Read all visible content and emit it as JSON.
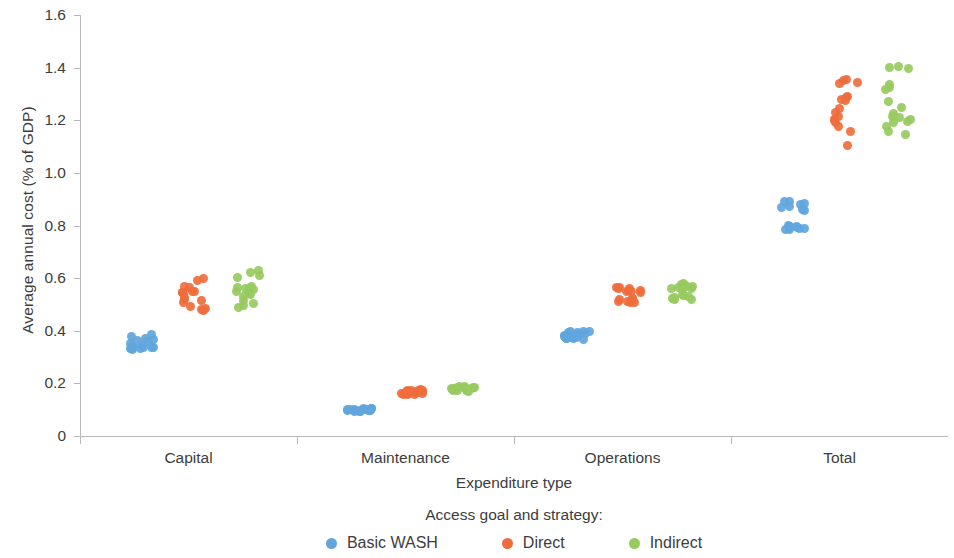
{
  "chart_data": {
    "type": "scatter",
    "title": "",
    "xlabel": "Expenditure type",
    "ylabel": "Average annual cost (% of GDP)",
    "categories": [
      "Capital",
      "Maintenance",
      "Operations",
      "Total"
    ],
    "ylim": [
      0,
      1.6
    ],
    "yticks": [
      "0",
      "0.2",
      "0.4",
      "0.6",
      "0.8",
      "1.0",
      "1.2",
      "1.4",
      "1.6"
    ],
    "ytick_values": [
      0,
      0.2,
      0.4,
      0.6,
      0.8,
      1.0,
      1.2,
      1.4,
      1.6
    ],
    "grid": false,
    "legend_position": "bottom",
    "legend_title": "Access goal and strategy:",
    "series": [
      {
        "name": "Basic WASH",
        "color": "#61a5dd",
        "values_by_category": {
          "Capital": [
            0.335,
            0.336,
            0.338,
            0.34,
            0.333,
            0.332,
            0.364,
            0.37,
            0.38,
            0.384,
            0.366,
            0.358,
            0.352,
            0.344,
            0.338,
            0.334,
            0.33
          ],
          "Maintenance": [
            0.104,
            0.102,
            0.1,
            0.1,
            0.098,
            0.097,
            0.096,
            0.096,
            0.104,
            0.106,
            0.102,
            0.1,
            0.098,
            0.096,
            0.094,
            0.093,
            0.092
          ],
          "Operations": [
            0.392,
            0.394,
            0.396,
            0.398,
            0.396,
            0.39,
            0.384,
            0.378,
            0.374,
            0.372,
            0.376,
            0.382,
            0.38,
            0.374,
            0.372,
            0.37,
            0.368
          ],
          "Total": [
            0.88,
            0.884,
            0.89,
            0.892,
            0.87,
            0.862,
            0.856,
            0.872,
            0.8,
            0.798,
            0.794,
            0.79,
            0.788,
            0.792,
            0.796,
            0.786,
            0.784
          ]
        }
      },
      {
        "name": "Direct",
        "color": "#ef6d3c",
        "values_by_category": {
          "Capital": [
            0.6,
            0.592,
            0.57,
            0.566,
            0.55,
            0.548,
            0.546,
            0.544,
            0.54,
            0.528,
            0.52,
            0.514,
            0.508,
            0.494,
            0.486,
            0.482,
            0.476
          ],
          "Maintenance": [
            0.176,
            0.174,
            0.172,
            0.17,
            0.168,
            0.166,
            0.164,
            0.162,
            0.16,
            0.158,
            0.156,
            0.158,
            0.162,
            0.166,
            0.17,
            0.172,
            0.174
          ],
          "Operations": [
            0.566,
            0.564,
            0.56,
            0.554,
            0.548,
            0.544,
            0.548,
            0.554,
            0.56,
            0.524,
            0.518,
            0.512,
            0.508,
            0.506,
            0.51,
            0.516,
            0.522
          ],
          "Total": [
            1.356,
            1.35,
            1.344,
            1.34,
            1.292,
            1.286,
            1.28,
            1.274,
            1.244,
            1.228,
            1.214,
            1.204,
            1.198,
            1.192,
            1.176,
            1.156,
            1.104
          ]
        }
      },
      {
        "name": "Indirect",
        "color": "#97ca5f",
        "values_by_category": {
          "Capital": [
            0.628,
            0.622,
            0.61,
            0.604,
            0.57,
            0.566,
            0.562,
            0.56,
            0.556,
            0.548,
            0.542,
            0.538,
            0.53,
            0.514,
            0.502,
            0.496,
            0.49
          ],
          "Maintenance": [
            0.19,
            0.188,
            0.186,
            0.184,
            0.182,
            0.18,
            0.178,
            0.176,
            0.174,
            0.172,
            0.17,
            0.172,
            0.176,
            0.18,
            0.182,
            0.184,
            0.186
          ],
          "Operations": [
            0.578,
            0.576,
            0.572,
            0.568,
            0.562,
            0.558,
            0.562,
            0.566,
            0.57,
            0.536,
            0.53,
            0.524,
            0.52,
            0.518,
            0.522,
            0.528,
            0.534
          ],
          "Total": [
            1.406,
            1.4,
            1.396,
            1.336,
            1.324,
            1.318,
            1.272,
            1.248,
            1.226,
            1.216,
            1.21,
            1.204,
            1.196,
            1.19,
            1.178,
            1.156,
            1.144
          ]
        }
      }
    ]
  },
  "axis": {
    "ylabel": "Average annual cost (% of GDP)",
    "xlabel": "Expenditure type"
  },
  "legend": {
    "title": "Access goal and strategy:",
    "items": [
      {
        "label": "Basic WASH",
        "color": "#61a5dd"
      },
      {
        "label": "Direct",
        "color": "#ef6d3c"
      },
      {
        "label": "Indirect",
        "color": "#97ca5f"
      }
    ]
  }
}
